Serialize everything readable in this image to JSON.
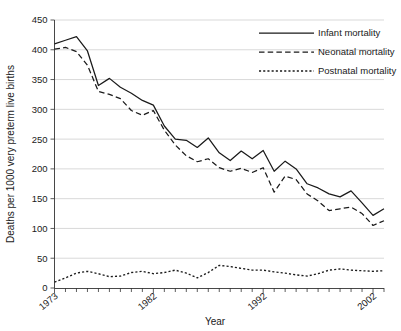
{
  "chart_data": {
    "type": "line",
    "title": "",
    "xlabel": "Year",
    "ylabel": "Deaths per 1000 very preterm live births",
    "xlim": [
      1973,
      2003
    ],
    "ylim": [
      0,
      450
    ],
    "ytick_step": 50,
    "grid": true,
    "legend_position": "top-right",
    "yticks": [
      "0",
      "50",
      "100",
      "150",
      "200",
      "250",
      "300",
      "350",
      "400",
      "450"
    ],
    "xticks": [
      "1973",
      "1982",
      "1992",
      "2002"
    ],
    "xtick_values": [
      1973,
      1982,
      1992,
      2002
    ],
    "x": [
      1973,
      1974,
      1975,
      1976,
      1977,
      1978,
      1979,
      1980,
      1981,
      1982,
      1983,
      1984,
      1985,
      1986,
      1987,
      1988,
      1989,
      1990,
      1991,
      1992,
      1993,
      1994,
      1995,
      1996,
      1997,
      1998,
      1999,
      2000,
      2001,
      2002,
      2003
    ],
    "series": [
      {
        "name": "Infant mortality",
        "style": "solid",
        "values": [
          410,
          416,
          422,
          398,
          340,
          352,
          337,
          327,
          315,
          307,
          272,
          250,
          248,
          236,
          252,
          227,
          214,
          230,
          217,
          231,
          196,
          213,
          200,
          175,
          168,
          158,
          153,
          163,
          143,
          122,
          133
        ]
      },
      {
        "name": "Neonatal mortality",
        "style": "dashed",
        "values": [
          401,
          404,
          397,
          374,
          330,
          325,
          318,
          298,
          290,
          298,
          265,
          240,
          222,
          212,
          217,
          202,
          196,
          201,
          194,
          202,
          161,
          188,
          182,
          158,
          146,
          130,
          133,
          136,
          125,
          105,
          113
        ]
      },
      {
        "name": "Postnatal mortality",
        "style": "dotted",
        "values": [
          10,
          17,
          25,
          28,
          24,
          19,
          20,
          26,
          28,
          24,
          26,
          30,
          25,
          17,
          26,
          38,
          36,
          33,
          30,
          30,
          27,
          25,
          22,
          20,
          24,
          30,
          32,
          30,
          29,
          28,
          29
        ]
      }
    ]
  },
  "legend": {
    "items": [
      {
        "label": "Infant mortality",
        "style": "solid"
      },
      {
        "label": "Neonatal mortality",
        "style": "dashed"
      },
      {
        "label": "Postnatal mortality",
        "style": "dotted"
      }
    ]
  }
}
